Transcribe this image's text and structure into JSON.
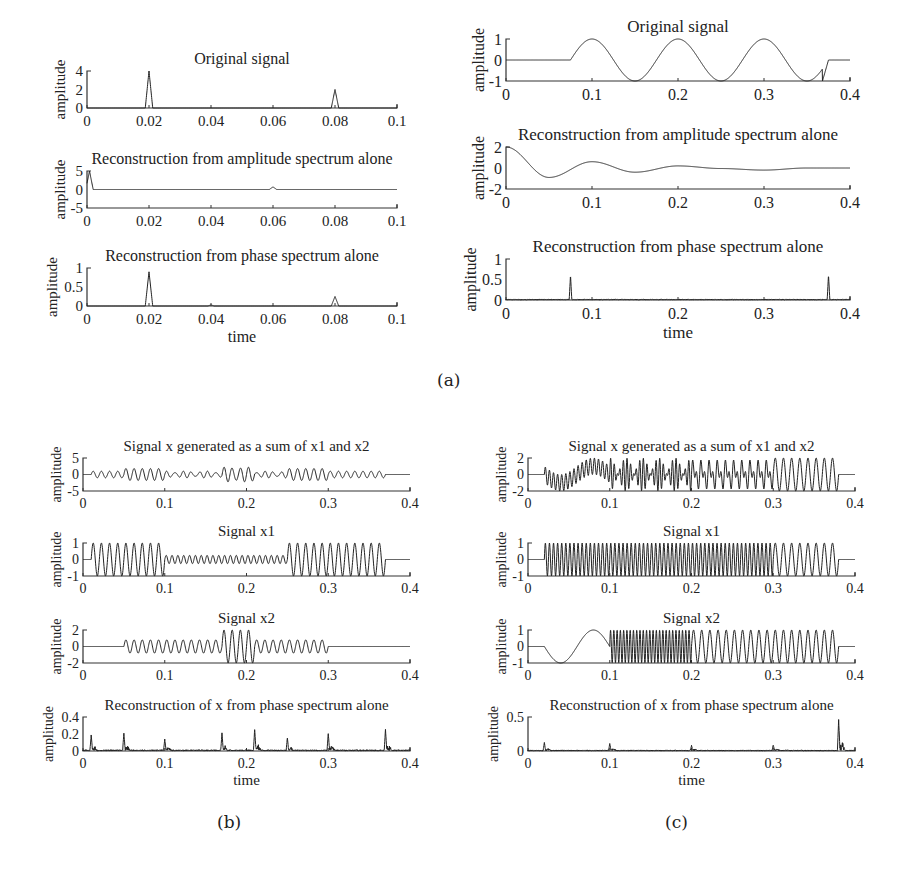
{
  "figure": {
    "captions": {
      "a": "(a)",
      "b": "(b)",
      "c": "(c)"
    }
  },
  "chart_data": [
    {
      "id": "a-left-1",
      "panel": "a",
      "type": "line",
      "title": "Original signal",
      "xlabel": "",
      "ylabel": "amplitude",
      "xlim": [
        0,
        0.1
      ],
      "ylim": [
        0,
        4
      ],
      "xticks": [
        "0",
        "0.02",
        "0.04",
        "0.06",
        "0.08",
        "0.1"
      ],
      "yticks": [
        "0",
        "2",
        "4"
      ],
      "series": [
        {
          "name": "signal",
          "description": "two triangular pulses",
          "peaks": [
            {
              "x": 0.02,
              "y": 4
            },
            {
              "x": 0.08,
              "y": 2
            }
          ]
        }
      ],
      "box": {
        "x": 87,
        "y": 71,
        "w": 310,
        "h": 37
      }
    },
    {
      "id": "a-left-2",
      "panel": "a",
      "type": "line",
      "title": "Reconstruction from amplitude spectrum alone",
      "xlabel": "",
      "ylabel": "amplitude",
      "xlim": [
        0,
        0.1
      ],
      "ylim": [
        -5,
        5
      ],
      "xticks": [
        "0",
        "0.02",
        "0.04",
        "0.06",
        "0.08",
        "0.1"
      ],
      "yticks": [
        "-5",
        "0",
        "5"
      ],
      "series": [
        {
          "name": "reconstruction",
          "description": "spike near 0, small bump at 0.06",
          "peaks": [
            {
              "x": 0.001,
              "y": 5
            },
            {
              "x": 0.06,
              "y": 0.7
            }
          ]
        }
      ],
      "box": {
        "x": 87,
        "y": 171,
        "w": 310,
        "h": 37
      }
    },
    {
      "id": "a-left-3",
      "panel": "a",
      "type": "line",
      "title": "Reconstruction from phase spectrum alone",
      "xlabel": "time",
      "ylabel": "amplitude",
      "xlim": [
        0,
        0.1
      ],
      "ylim": [
        0,
        1
      ],
      "xticks": [
        "0",
        "0.02",
        "0.04",
        "0.06",
        "0.08",
        "0.1"
      ],
      "yticks": [
        "0",
        "0.5",
        "1"
      ],
      "series": [
        {
          "name": "reconstruction",
          "peaks": [
            {
              "x": 0.02,
              "y": 0.9
            },
            {
              "x": 0.04,
              "y": 0.03
            },
            {
              "x": 0.08,
              "y": 0.25
            }
          ]
        }
      ],
      "box": {
        "x": 87,
        "y": 268,
        "w": 310,
        "h": 38
      }
    },
    {
      "id": "a-right-1",
      "panel": "a",
      "type": "line",
      "title": "Original signal",
      "xlabel": "",
      "ylabel": "amplitude",
      "xlim": [
        0,
        0.4
      ],
      "ylim": [
        -1,
        1
      ],
      "xticks": [
        "0",
        "0.1",
        "0.2",
        "0.3",
        "0.4"
      ],
      "yticks": [
        "-1",
        "0",
        "1"
      ],
      "series": [
        {
          "name": "signal",
          "description": "cosine with period 0.1 between 0.075 and 0.375, zero elsewhere",
          "x": [
            0,
            0.075,
            0.1,
            0.15,
            0.2,
            0.25,
            0.3,
            0.35,
            0.375,
            0.4
          ],
          "y": [
            0,
            0,
            1,
            -1,
            1,
            -1,
            1,
            -1,
            0,
            0
          ]
        }
      ],
      "box": {
        "x": 506,
        "y": 39,
        "w": 344,
        "h": 42
      }
    },
    {
      "id": "a-right-2",
      "panel": "a",
      "type": "line",
      "title": "Reconstruction from amplitude spectrum alone",
      "xlabel": "",
      "ylabel": "amplitude",
      "xlim": [
        0,
        0.4
      ],
      "ylim": [
        -2,
        2
      ],
      "xticks": [
        "0",
        "0.1",
        "0.2",
        "0.3",
        "0.4"
      ],
      "yticks": [
        "-2",
        "0",
        "2"
      ],
      "series": [
        {
          "name": "reconstruction",
          "description": "damped oscillation",
          "x": [
            0,
            0.05,
            0.1,
            0.15,
            0.2,
            0.25,
            0.3,
            0.35,
            0.4
          ],
          "y": [
            2,
            -0.9,
            0.6,
            -0.4,
            0.2,
            -0.05,
            -0.2,
            0,
            0
          ]
        }
      ],
      "box": {
        "x": 506,
        "y": 147,
        "w": 344,
        "h": 42
      }
    },
    {
      "id": "a-right-3",
      "panel": "a",
      "type": "line",
      "title": "Reconstruction from phase spectrum alone",
      "xlabel": "time",
      "ylabel": "amplitude",
      "xlim": [
        0,
        0.4
      ],
      "ylim": [
        0,
        1
      ],
      "xticks": [
        "0",
        "0.1",
        "0.2",
        "0.3",
        "0.4"
      ],
      "yticks": [
        "0",
        "0.5",
        "1"
      ],
      "series": [
        {
          "name": "reconstruction",
          "peaks": [
            {
              "x": 0.075,
              "y": 0.6
            },
            {
              "x": 0.375,
              "y": 0.62
            }
          ]
        }
      ],
      "box": {
        "x": 506,
        "y": 259,
        "w": 344,
        "h": 41
      }
    },
    {
      "id": "b-1",
      "panel": "b",
      "type": "line",
      "title": "Signal x generated as a sum of x1 and x2",
      "xlabel": "",
      "ylabel": "amplitude",
      "xlim": [
        0,
        0.4
      ],
      "ylim": [
        -5,
        5
      ],
      "xticks": [
        "0",
        "0.1",
        "0.2",
        "0.3",
        "0.4"
      ],
      "yticks": [
        "-5",
        "0",
        "5"
      ],
      "series": [
        {
          "name": "x = x1 + x2",
          "description": "sum of oscillations, amplitude up to ~2.5"
        }
      ],
      "box": {
        "x": 83,
        "y": 458,
        "w": 327,
        "h": 33
      }
    },
    {
      "id": "b-2",
      "panel": "b",
      "type": "line",
      "title": "Signal x1",
      "xlabel": "",
      "ylabel": "amplitude",
      "xlim": [
        0,
        0.4
      ],
      "ylim": [
        -1,
        1
      ],
      "xticks": [
        "0",
        "0.1",
        "0.2",
        "0.3",
        "0.4"
      ],
      "yticks": [
        "-1",
        "0",
        "1"
      ],
      "series": [
        {
          "name": "x1",
          "segments": [
            {
              "from": 0.01,
              "to": 0.1,
              "amp": 1,
              "freq": 100
            },
            {
              "from": 0.1,
              "to": 0.25,
              "amp": 0.25,
              "freq": 140
            },
            {
              "from": 0.25,
              "to": 0.37,
              "amp": 1,
              "freq": 100
            }
          ]
        }
      ],
      "box": {
        "x": 83,
        "y": 543,
        "w": 327,
        "h": 33
      }
    },
    {
      "id": "b-3",
      "panel": "b",
      "type": "line",
      "title": "Signal x2",
      "xlabel": "",
      "ylabel": "amplitude",
      "xlim": [
        0,
        0.4
      ],
      "ylim": [
        -2,
        2
      ],
      "xticks": [
        "0",
        "0.1",
        "0.2",
        "0.3",
        "0.4"
      ],
      "yticks": [
        "-2",
        "0",
        "2"
      ],
      "series": [
        {
          "name": "x2",
          "segments": [
            {
              "from": 0.05,
              "to": 0.17,
              "amp": 0.8,
              "freq": 100
            },
            {
              "from": 0.17,
              "to": 0.21,
              "amp": 2,
              "freq": 100
            },
            {
              "from": 0.21,
              "to": 0.3,
              "amp": 0.8,
              "freq": 100
            }
          ]
        }
      ],
      "box": {
        "x": 83,
        "y": 630,
        "w": 327,
        "h": 33
      }
    },
    {
      "id": "b-4",
      "panel": "b",
      "type": "line",
      "title": "Reconstruction of x from phase spectrum alone",
      "xlabel": "time",
      "ylabel": "amplitude",
      "xlim": [
        0,
        0.4
      ],
      "ylim": [
        0,
        0.4
      ],
      "xticks": [
        "0",
        "0.1",
        "0.2",
        "0.3",
        "0.4"
      ],
      "yticks": [
        "0",
        "0.2",
        "0.4"
      ],
      "series": [
        {
          "name": "reconstruction",
          "peaks": [
            {
              "x": 0.01,
              "y": 0.18
            },
            {
              "x": 0.05,
              "y": 0.2
            },
            {
              "x": 0.1,
              "y": 0.13
            },
            {
              "x": 0.17,
              "y": 0.2
            },
            {
              "x": 0.21,
              "y": 0.25
            },
            {
              "x": 0.25,
              "y": 0.15
            },
            {
              "x": 0.3,
              "y": 0.2
            },
            {
              "x": 0.37,
              "y": 0.25
            }
          ]
        }
      ],
      "box": {
        "x": 83,
        "y": 717,
        "w": 327,
        "h": 34
      }
    },
    {
      "id": "c-1",
      "panel": "c",
      "type": "line",
      "title": "Signal x generated as a sum of x1 and x2",
      "xlabel": "",
      "ylabel": "amplitude",
      "xlim": [
        0,
        0.4
      ],
      "ylim": [
        -2,
        2
      ],
      "xticks": [
        "0",
        "0.1",
        "0.2",
        "0.3",
        "0.4"
      ],
      "yticks": [
        "-2",
        "0",
        "2"
      ],
      "series": [
        {
          "name": "x = x1 + x2",
          "description": "sum of x1 and x2"
        }
      ],
      "box": {
        "x": 528,
        "y": 458,
        "w": 327,
        "h": 33
      }
    },
    {
      "id": "c-2",
      "panel": "c",
      "type": "line",
      "title": "Signal x1",
      "xlabel": "",
      "ylabel": "amplitude",
      "xlim": [
        0,
        0.4
      ],
      "ylim": [
        -1,
        1
      ],
      "xticks": [
        "0",
        "0.1",
        "0.2",
        "0.3",
        "0.4"
      ],
      "yticks": [
        "-1",
        "0",
        "1"
      ],
      "series": [
        {
          "name": "x1",
          "segments": [
            {
              "from": 0.02,
              "to": 0.3,
              "amp": 1,
              "freq": 200
            },
            {
              "from": 0.3,
              "to": 0.38,
              "amp": 1,
              "freq": 100
            }
          ]
        }
      ],
      "box": {
        "x": 528,
        "y": 543,
        "w": 327,
        "h": 33
      }
    },
    {
      "id": "c-3",
      "panel": "c",
      "type": "line",
      "title": "Signal x2",
      "xlabel": "",
      "ylabel": "amplitude",
      "xlim": [
        0,
        0.4
      ],
      "ylim": [
        -1,
        1
      ],
      "xticks": [
        "0",
        "0.1",
        "0.2",
        "0.3",
        "0.4"
      ],
      "yticks": [
        "-1",
        "0",
        "1"
      ],
      "series": [
        {
          "name": "x2",
          "segments": [
            {
              "from": 0.02,
              "to": 0.1,
              "amp": 1,
              "freq": 12.5,
              "kind": "slow"
            },
            {
              "from": 0.1,
              "to": 0.2,
              "amp": 1,
              "freq": 250
            },
            {
              "from": 0.2,
              "to": 0.38,
              "amp": 1,
              "freq": 100
            }
          ]
        }
      ],
      "box": {
        "x": 528,
        "y": 630,
        "w": 327,
        "h": 33
      }
    },
    {
      "id": "c-4",
      "panel": "c",
      "type": "line",
      "title": "Reconstruction of x from phase spectrum alone",
      "xlabel": "time",
      "ylabel": "amplitude",
      "xlim": [
        0,
        0.4
      ],
      "ylim": [
        0,
        0.5
      ],
      "xticks": [
        "0",
        "0.1",
        "0.2",
        "0.3",
        "0.4"
      ],
      "yticks": [
        "0",
        "0.5"
      ],
      "series": [
        {
          "name": "reconstruction",
          "peaks": [
            {
              "x": 0.02,
              "y": 0.12
            },
            {
              "x": 0.1,
              "y": 0.1
            },
            {
              "x": 0.2,
              "y": 0.07
            },
            {
              "x": 0.3,
              "y": 0.08
            },
            {
              "x": 0.38,
              "y": 0.45
            }
          ]
        }
      ],
      "box": {
        "x": 528,
        "y": 717,
        "w": 327,
        "h": 34
      }
    }
  ]
}
